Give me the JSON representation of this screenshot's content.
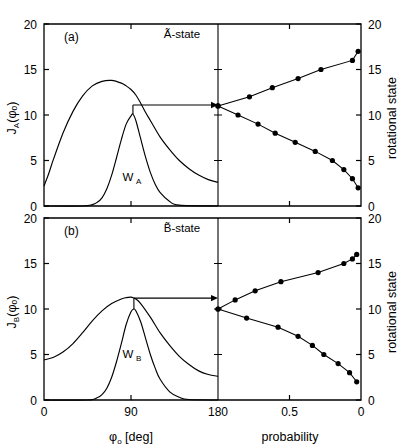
{
  "figure": {
    "width": 407,
    "height": 446,
    "background": "#ffffff",
    "ink": "#000000"
  },
  "panels": [
    {
      "tag": "(a)",
      "title": "Ã-state",
      "ylabel_main": "J",
      "ylabel_sub": "A",
      "ylabel_arg": "(φₒ)",
      "ylabel_full": "J_A(φₒ)",
      "curve_label": "W",
      "curve_label_sub": "A",
      "curve_label_full": "W_A"
    },
    {
      "tag": "(b)",
      "title": "B̃-state",
      "ylabel_main": "J",
      "ylabel_sub": "B",
      "ylabel_arg": "(φₒ)",
      "ylabel_full": "J_B(φₒ)",
      "curve_label": "W",
      "curve_label_sub": "B",
      "curve_label_full": "W_B"
    }
  ],
  "axes": {
    "left_ticks": [
      "0",
      "5",
      "10",
      "15",
      "20"
    ],
    "left_tick_values": [
      0,
      5,
      10,
      15,
      20
    ],
    "right_ticks": [
      "0",
      "5",
      "10",
      "15",
      "20"
    ],
    "right_tick_values": [
      0,
      5,
      10,
      15,
      20
    ],
    "right_label": "rotational state",
    "x_left_ticks": [
      "0",
      "90",
      "180"
    ],
    "x_left_tick_values": [
      0,
      90,
      180
    ],
    "x_left_label_main": "φ",
    "x_left_label_sub": "o",
    "x_left_label_unit": "[deg]",
    "x_left_label_full": "φₒ  [deg]",
    "x_right_ticks": [
      "0.5",
      "0"
    ],
    "x_right_tick_values": [
      0.5,
      0
    ],
    "x_right_label": "probability",
    "ylim": [
      0,
      20
    ],
    "xlim_left": [
      0,
      180
    ],
    "xlim_right": [
      1.0,
      0.0
    ]
  },
  "chart_data": {
    "type": "line",
    "grid": false,
    "legend": "none",
    "subplots": [
      {
        "id": "a",
        "tag": "(a)",
        "title": "Ã-state",
        "xlabel": "φₒ  [deg]",
        "ylabel": "J_A(φₒ)",
        "xlim": [
          0,
          180
        ],
        "ylim": [
          0,
          20
        ],
        "series": [
          {
            "name": "J_A(φₒ)",
            "type": "line",
            "x": [
              0,
              5,
              10,
              20,
              30,
              40,
              50,
              60,
              70,
              80,
              85,
              90,
              95,
              100,
              105,
              110,
              120,
              130,
              140,
              150,
              160,
              170,
              180
            ],
            "values": [
              2.2,
              3.6,
              5.2,
              8.1,
              10.4,
              12.1,
              13.2,
              13.7,
              13.8,
              13.5,
              13.2,
              12.8,
              12.2,
              11.3,
              10.3,
              9.4,
              7.6,
              6.2,
              5.0,
              4.1,
              3.4,
              2.9,
              2.6
            ]
          },
          {
            "name": "W_A(φₒ)",
            "type": "line",
            "x": [
              0,
              40,
              50,
              55,
              60,
              65,
              70,
              75,
              80,
              85,
              90,
              92,
              95,
              100,
              105,
              110,
              115,
              120,
              130,
              140,
              180
            ],
            "values": [
              0.0,
              0.0,
              0.15,
              0.4,
              0.9,
              1.9,
              3.4,
              5.3,
              7.3,
              9.0,
              9.9,
              10.1,
              9.4,
              7.4,
              5.4,
              3.7,
              2.4,
              1.5,
              0.5,
              0.1,
              0.0
            ]
          }
        ],
        "annotation": {
          "type": "arrow",
          "from_x": 92,
          "from_y": 11.1,
          "to_x": 180,
          "to_y": 11.1,
          "note": "horizontal arrow at J=11 from peak of W_A to panel divider"
        },
        "distribution": {
          "xlabel": "probability",
          "ylabel": "rotational state",
          "xlim": [
            1.0,
            0.0
          ],
          "ylim": [
            0,
            20
          ],
          "note": "two branches of final rotational state distribution vs probability, joined at state 11",
          "upper_branch": {
            "name": "upper branch",
            "states": [
              11,
              12,
              13,
              14,
              15,
              16,
              17
            ],
            "probabilities": [
              1.0,
              0.78,
              0.62,
              0.44,
              0.28,
              0.06,
              0.02
            ]
          },
          "lower_branch": {
            "name": "lower branch",
            "states": [
              11,
              10,
              9,
              8,
              7,
              6,
              5,
              4,
              3,
              2
            ],
            "probabilities": [
              1.0,
              0.86,
              0.72,
              0.6,
              0.46,
              0.32,
              0.2,
              0.12,
              0.06,
              0.02
            ]
          }
        }
      },
      {
        "id": "b",
        "tag": "(b)",
        "title": "B̃-state",
        "xlabel": "φₒ  [deg]",
        "ylabel": "J_B(φₒ)",
        "xlim": [
          0,
          180
        ],
        "ylim": [
          0,
          20
        ],
        "series": [
          {
            "name": "J_B(φₒ)",
            "type": "line",
            "x": [
              0,
              10,
              20,
              30,
              40,
              50,
              60,
              70,
              80,
              85,
              90,
              93,
              95,
              100,
              110,
              120,
              130,
              140,
              150,
              160,
              170,
              180
            ],
            "values": [
              4.4,
              4.7,
              5.3,
              6.2,
              7.4,
              8.7,
              9.8,
              10.6,
              11.1,
              11.25,
              11.3,
              11.2,
              11.1,
              10.6,
              9.1,
              7.4,
              6.0,
              4.8,
              3.9,
              3.2,
              2.8,
              2.6
            ]
          },
          {
            "name": "W_B(φₒ)",
            "type": "line",
            "x": [
              0,
              45,
              55,
              60,
              65,
              70,
              75,
              80,
              85,
              90,
              93,
              95,
              100,
              105,
              110,
              115,
              120,
              130,
              140,
              150,
              180
            ],
            "values": [
              0.0,
              0.0,
              0.25,
              0.6,
              1.3,
              2.5,
              4.2,
              6.2,
              8.3,
              9.7,
              10.0,
              9.8,
              8.6,
              6.8,
              5.0,
              3.5,
              2.3,
              0.9,
              0.3,
              0.05,
              0.0
            ]
          }
        ],
        "annotation": {
          "type": "arrow",
          "from_x": 93,
          "from_y": 11.2,
          "to_x": 180,
          "to_y": 11.2,
          "note": "horizontal arrow at J=11 from peak of W_B to panel divider"
        },
        "distribution": {
          "xlabel": "probability",
          "ylabel": "rotational state",
          "xlim": [
            1.0,
            0.0
          ],
          "ylim": [
            0,
            20
          ],
          "note": "two branches of final rotational state distribution vs probability, joined at state 10",
          "upper_branch": {
            "name": "upper branch",
            "states": [
              10,
              11,
              12,
              13,
              14,
              15,
              15.5,
              16
            ],
            "probabilities": [
              1.0,
              0.88,
              0.74,
              0.56,
              0.3,
              0.12,
              0.06,
              0.03
            ]
          },
          "lower_branch": {
            "name": "lower branch",
            "states": [
              10,
              9,
              8,
              7,
              6,
              5,
              4,
              3,
              2
            ],
            "probabilities": [
              1.0,
              0.8,
              0.58,
              0.44,
              0.34,
              0.26,
              0.16,
              0.08,
              0.03
            ]
          }
        }
      }
    ]
  }
}
